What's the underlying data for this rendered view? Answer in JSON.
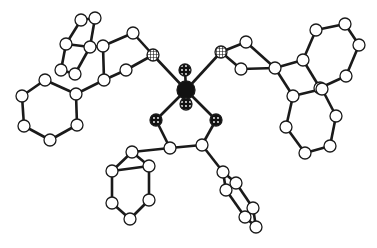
{
  "diagram": {
    "type": "molecular-structure",
    "style": "ball-and-stick",
    "colors": {
      "bond": "#1a1a1a",
      "atom_fill": "#ffffff",
      "atom_stroke": "#1a1a1a",
      "metal": "#111111"
    },
    "atoms": [
      {
        "id": "M",
        "el": "metal",
        "x": 186,
        "y": 90,
        "r": 9
      },
      {
        "id": "Oa",
        "el": "O",
        "x": 185,
        "y": 70,
        "r": 6
      },
      {
        "id": "Ob",
        "el": "O",
        "x": 186,
        "y": 104,
        "r": 6
      },
      {
        "id": "P1",
        "el": "P",
        "x": 153,
        "y": 55,
        "r": 6
      },
      {
        "id": "P2",
        "el": "P",
        "x": 221,
        "y": 52,
        "r": 6
      },
      {
        "id": "S1",
        "el": "S",
        "x": 156,
        "y": 120,
        "r": 6
      },
      {
        "id": "S2",
        "el": "S",
        "x": 216,
        "y": 120,
        "r": 6
      },
      {
        "id": "C1",
        "el": "C",
        "x": 170,
        "y": 148,
        "r": 6
      },
      {
        "id": "C2",
        "el": "C",
        "x": 202,
        "y": 145,
        "r": 6
      },
      {
        "id": "C3",
        "el": "C",
        "x": 133,
        "y": 33,
        "r": 6
      },
      {
        "id": "C4",
        "el": "C",
        "x": 126,
        "y": 70,
        "r": 6
      },
      {
        "id": "C5",
        "el": "C",
        "x": 103,
        "y": 46,
        "r": 6
      },
      {
        "id": "C6",
        "el": "C",
        "x": 104,
        "y": 80,
        "r": 6
      },
      {
        "id": "C7",
        "el": "C",
        "x": 90,
        "y": 47,
        "r": 6
      },
      {
        "id": "C8",
        "el": "C",
        "x": 66,
        "y": 44,
        "r": 6
      },
      {
        "id": "C9",
        "el": "C",
        "x": 81,
        "y": 20,
        "r": 6
      },
      {
        "id": "C10",
        "el": "C",
        "x": 95,
        "y": 18,
        "r": 6
      },
      {
        "id": "C11",
        "el": "C",
        "x": 61,
        "y": 70,
        "r": 6
      },
      {
        "id": "C12",
        "el": "C",
        "x": 75,
        "y": 74,
        "r": 6
      },
      {
        "id": "C13",
        "el": "C",
        "x": 76,
        "y": 94,
        "r": 6
      },
      {
        "id": "C14",
        "el": "C",
        "x": 45,
        "y": 80,
        "r": 6
      },
      {
        "id": "C15",
        "el": "C",
        "x": 22,
        "y": 96,
        "r": 6
      },
      {
        "id": "C16",
        "el": "C",
        "x": 24,
        "y": 126,
        "r": 6
      },
      {
        "id": "C17",
        "el": "C",
        "x": 50,
        "y": 140,
        "r": 6
      },
      {
        "id": "C18",
        "el": "C",
        "x": 77,
        "y": 125,
        "r": 6
      },
      {
        "id": "C19",
        "el": "C",
        "x": 246,
        "y": 42,
        "r": 6
      },
      {
        "id": "C20",
        "el": "C",
        "x": 241,
        "y": 69,
        "r": 6
      },
      {
        "id": "C21",
        "el": "C",
        "x": 275,
        "y": 68,
        "r": 6
      },
      {
        "id": "C22",
        "el": "C",
        "x": 303,
        "y": 60,
        "r": 6
      },
      {
        "id": "C23",
        "el": "C",
        "x": 316,
        "y": 30,
        "r": 6
      },
      {
        "id": "C24",
        "el": "C",
        "x": 345,
        "y": 24,
        "r": 6
      },
      {
        "id": "C25",
        "el": "C",
        "x": 359,
        "y": 45,
        "r": 6
      },
      {
        "id": "C26",
        "el": "C",
        "x": 346,
        "y": 76,
        "r": 6
      },
      {
        "id": "C27",
        "el": "C",
        "x": 320,
        "y": 88,
        "r": 6
      },
      {
        "id": "C28",
        "el": "C",
        "x": 293,
        "y": 96,
        "r": 6
      },
      {
        "id": "C29",
        "el": "C",
        "x": 286,
        "y": 127,
        "r": 6
      },
      {
        "id": "C30",
        "el": "C",
        "x": 305,
        "y": 153,
        "r": 6
      },
      {
        "id": "C31",
        "el": "C",
        "x": 330,
        "y": 146,
        "r": 6
      },
      {
        "id": "C32",
        "el": "C",
        "x": 336,
        "y": 116,
        "r": 6
      },
      {
        "id": "C33",
        "el": "C",
        "x": 322,
        "y": 89,
        "r": 6
      },
      {
        "id": "C34",
        "el": "C",
        "x": 149,
        "y": 166,
        "r": 6
      },
      {
        "id": "C35",
        "el": "C",
        "x": 132,
        "y": 152,
        "r": 6
      },
      {
        "id": "C36",
        "el": "C",
        "x": 112,
        "y": 171,
        "r": 6
      },
      {
        "id": "C37",
        "el": "C",
        "x": 112,
        "y": 203,
        "r": 6
      },
      {
        "id": "C38",
        "el": "C",
        "x": 130,
        "y": 219,
        "r": 6
      },
      {
        "id": "C39",
        "el": "C",
        "x": 149,
        "y": 200,
        "r": 6
      },
      {
        "id": "C40",
        "el": "C",
        "x": 223,
        "y": 172,
        "r": 6
      },
      {
        "id": "C41",
        "el": "C",
        "x": 236,
        "y": 183,
        "r": 6
      },
      {
        "id": "C42",
        "el": "C",
        "x": 226,
        "y": 190,
        "r": 6
      },
      {
        "id": "C43",
        "el": "C",
        "x": 253,
        "y": 208,
        "r": 6
      },
      {
        "id": "C44",
        "el": "C",
        "x": 245,
        "y": 217,
        "r": 6
      },
      {
        "id": "C45",
        "el": "C",
        "x": 256,
        "y": 227,
        "r": 6
      }
    ],
    "bonds": [
      [
        "M",
        "Oa"
      ],
      [
        "M",
        "Ob"
      ],
      [
        "M",
        "P1"
      ],
      [
        "M",
        "P2"
      ],
      [
        "M",
        "S1"
      ],
      [
        "M",
        "S2"
      ],
      [
        "S1",
        "C1"
      ],
      [
        "S2",
        "C2"
      ],
      [
        "C1",
        "C2"
      ],
      [
        "P1",
        "C3"
      ],
      [
        "P1",
        "C4"
      ],
      [
        "P2",
        "C19"
      ],
      [
        "P2",
        "C20"
      ],
      [
        "C3",
        "C5"
      ],
      [
        "C4",
        "C6"
      ],
      [
        "C5",
        "C6"
      ],
      [
        "C5",
        "C7"
      ],
      [
        "C7",
        "C8"
      ],
      [
        "C8",
        "C9"
      ],
      [
        "C9",
        "C10"
      ],
      [
        "C10",
        "C7"
      ],
      [
        "C8",
        "C11"
      ],
      [
        "C11",
        "C12"
      ],
      [
        "C12",
        "C7"
      ],
      [
        "C6",
        "C13"
      ],
      [
        "C13",
        "C14"
      ],
      [
        "C14",
        "C15"
      ],
      [
        "C15",
        "C16"
      ],
      [
        "C16",
        "C17"
      ],
      [
        "C17",
        "C18"
      ],
      [
        "C18",
        "C13"
      ],
      [
        "C19",
        "C21"
      ],
      [
        "C20",
        "C21"
      ],
      [
        "C21",
        "C22"
      ],
      [
        "C22",
        "C23"
      ],
      [
        "C23",
        "C24"
      ],
      [
        "C24",
        "C25"
      ],
      [
        "C25",
        "C26"
      ],
      [
        "C26",
        "C27"
      ],
      [
        "C27",
        "C22"
      ],
      [
        "C21",
        "C28"
      ],
      [
        "C28",
        "C29"
      ],
      [
        "C29",
        "C30"
      ],
      [
        "C30",
        "C31"
      ],
      [
        "C31",
        "C32"
      ],
      [
        "C32",
        "C33"
      ],
      [
        "C33",
        "C28"
      ],
      [
        "C1",
        "C35"
      ],
      [
        "C35",
        "C34"
      ],
      [
        "C34",
        "C36"
      ],
      [
        "C35",
        "C36"
      ],
      [
        "C36",
        "C37"
      ],
      [
        "C37",
        "C38"
      ],
      [
        "C38",
        "C39"
      ],
      [
        "C39",
        "C34"
      ],
      [
        "C2",
        "C40"
      ],
      [
        "C40",
        "C41"
      ],
      [
        "C40",
        "C42"
      ],
      [
        "C41",
        "C43"
      ],
      [
        "C42",
        "C44"
      ],
      [
        "C43",
        "C45"
      ],
      [
        "C44",
        "C45"
      ]
    ]
  }
}
